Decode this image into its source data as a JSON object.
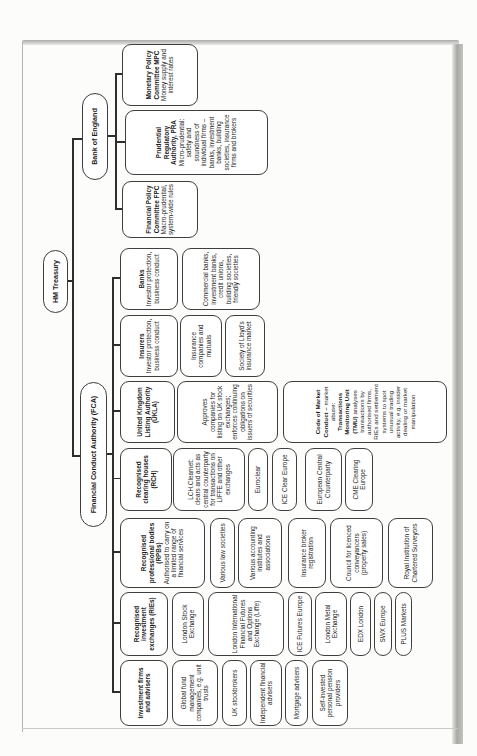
{
  "root": {
    "label": "HM Treasury"
  },
  "fca": {
    "label": "Financial Conduct Authority (FCA)",
    "columns": {
      "investment": {
        "title": "Investment firms and advisers",
        "children": [
          "Global fund management companies, e.g. unit trusts",
          "UK stockbrokers",
          "Independent financial advisers",
          "Mortgage advisers",
          "Self-invested personal pension providers"
        ]
      },
      "ries": {
        "title": "Recognised investment exchanges (RIEs)",
        "children": [
          "London Stock Exchange",
          "London International Financial Futures and Options Exchange (Liffe)",
          "ICE Futures Europe",
          "London Metal Exchange",
          "EDX London",
          "SWX Europe",
          "PLUS Markets"
        ]
      },
      "rpbs": {
        "title": "Recognised professional bodies (RPBs)",
        "subtitle": "Authorised to carry on a limited range of financial services",
        "children": [
          "Various law societies",
          "Various accounting institutes and associations",
          "Insurance broker registration",
          "Council for licenced conveyancers (property sales)",
          "Royal Institution of Chartered Surveyors"
        ]
      },
      "rch": {
        "title": "Recognised clearing houses (RCH)",
        "children": [
          "LCH.Clearnet: clears and acts as central counterparty for transactions on LIFFE and other exchanges",
          "Euroclear",
          "ICE Clear Europe",
          "European Central Counterparty",
          "CME Clearing Europe"
        ]
      },
      "ukla": {
        "title": "United Kingdom Listing Authority (UKLA)",
        "children": [
          "Approves companies for listing on UK stock exchanges; enforces continuing obligations on issuers of securities"
        ],
        "market_conduct": {
          "bold1": "Code of Market Conduct – ",
          "normal1": "market abuse: ",
          "bold2": "Transactions Monitoring Unit (TMU) ",
          "normal2": "analyses transactions by authorised firms, RIEs and settlement systems to spot unusual trading activity, e.g. insider dealing or market manipulation"
        }
      },
      "insurers": {
        "title": "Insurers",
        "subtitle": "Investor protection, business conduct",
        "children": [
          "Insurance companies and mutuals",
          "Society of Lloyd's insurance market"
        ]
      },
      "banks": {
        "title": "Banks",
        "subtitle": "Investor protection, business conduct",
        "children": [
          "Commercial banks, investment banks, credit unions, building societies, friendly societies"
        ]
      }
    }
  },
  "boe": {
    "label": "Bank of England",
    "committees": {
      "fpc": {
        "title": "Financial Policy Committee FPC",
        "body": "Macro-prudential, system-wide rules"
      },
      "pra": {
        "title": "Prudential Regulatory Authority, PRA",
        "body": "Micro-prudential: safety and soundness of individual firms – banks, investment banks, building societies, insurance firms and brokers"
      },
      "mpc": {
        "title": "Monetary Policy Committee MPC",
        "body": "Money supply and interest rates"
      }
    }
  },
  "colors": {
    "line": "#2e2e2c",
    "box_border": "#3e3e3c",
    "box_fill": "#ffffff",
    "text": "#1c1c1c",
    "page_edge": "#ababab"
  }
}
